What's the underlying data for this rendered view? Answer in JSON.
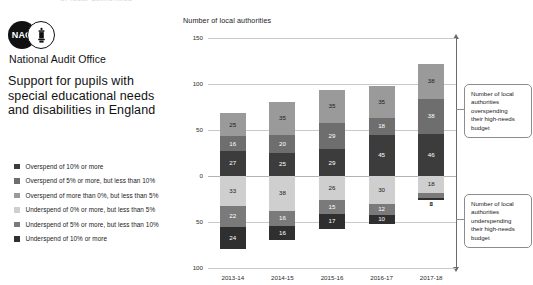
{
  "top_cutoff_text": "of local authorities",
  "brand": {
    "logo_text": "NAO",
    "crest_icon": "royal-crest-icon",
    "organisation": "National Audit Office",
    "publication_title_lines": [
      "Support for pupils with",
      "special educational needs",
      "and disabilities in England"
    ]
  },
  "legend": {
    "items": [
      {
        "label": "Overspend of 10% or more",
        "color": "#3c3c3c"
      },
      {
        "label": "Overspend of 5% or more, but less than 10%",
        "color": "#6e6e6e"
      },
      {
        "label": "Overspend of more than 0%, but less than 5%",
        "color": "#9a9a9a"
      },
      {
        "label": "Underspend of 0% or more, but less than 5%",
        "color": "#cfcfcf"
      },
      {
        "label": "Underspend of 5% or more, but less than 10%",
        "color": "#7a7a7a"
      },
      {
        "label": "Underspend of 10% or more",
        "color": "#2f2f2f"
      }
    ]
  },
  "callouts": {
    "overspending": {
      "lines": [
        "Number of local",
        "authorities",
        "overspending",
        "their high-needs",
        "budget"
      ]
    },
    "underspending": {
      "lines": [
        "Number of local",
        "authorities",
        "underspending",
        "their high-needs",
        "budget"
      ]
    }
  },
  "chart_data": {
    "type": "bar",
    "title": "Number of local authorities",
    "subtype": "stacked-diverging-bar",
    "xlabel": "",
    "ylabel": "Number of local authorities",
    "categories": [
      "2013-14",
      "2014-15",
      "2015-16",
      "2016-17",
      "2017-18"
    ],
    "ytick_labels": [
      "150",
      "100",
      "50",
      "0",
      "50",
      "100"
    ],
    "ytick_values": [
      150,
      100,
      50,
      0,
      -50,
      -100
    ],
    "ylim": [
      -100,
      150
    ],
    "grid": true,
    "legend_position": "left",
    "series": [
      {
        "name": "Overspend of 10% or more",
        "color": "#3c3c3c",
        "direction": "up",
        "values": [
          27,
          25,
          29,
          45,
          46
        ]
      },
      {
        "name": "Overspend of 5% or more, but less than 10%",
        "color": "#6e6e6e",
        "direction": "up",
        "values": [
          16,
          20,
          29,
          18,
          38
        ]
      },
      {
        "name": "Overspend of more than 0%, but less than 5%",
        "color": "#9a9a9a",
        "direction": "up",
        "values": [
          25,
          35,
          35,
          35,
          38
        ]
      },
      {
        "name": "Underspend of 0% or more, but less than 5%",
        "color": "#cfcfcf",
        "direction": "down",
        "values": [
          33,
          38,
          26,
          30,
          18
        ]
      },
      {
        "name": "Underspend of 5% or more, but less than 10%",
        "color": "#7a7a7a",
        "direction": "down",
        "values": [
          22,
          16,
          15,
          12,
          6
        ]
      },
      {
        "name": "Underspend of 10% or more",
        "color": "#2f2f2f",
        "direction": "down",
        "values": [
          24,
          16,
          17,
          10,
          2
        ]
      }
    ]
  }
}
